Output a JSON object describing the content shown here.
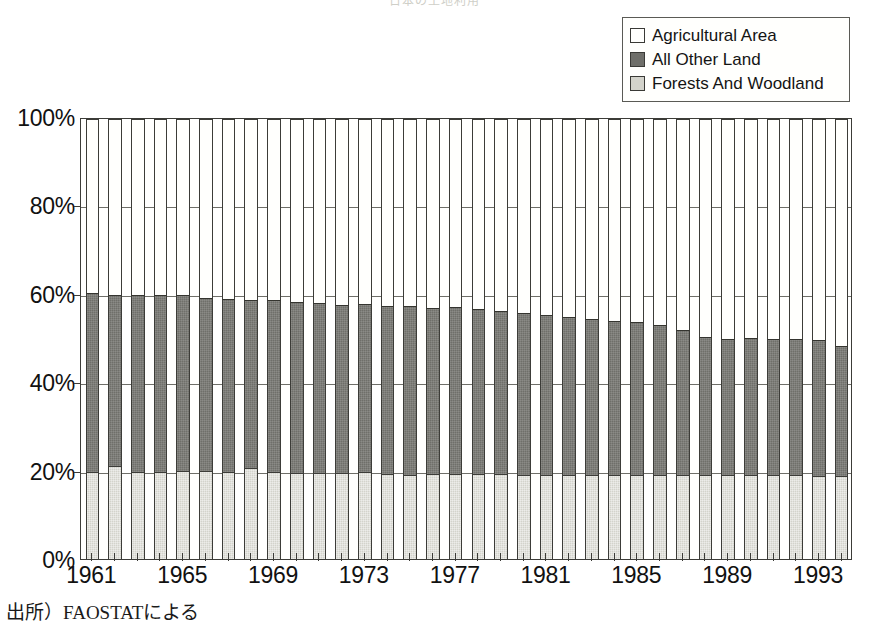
{
  "chart_title": "日本の土地利用",
  "source_note": "出所）FAOSTATによる",
  "legend": {
    "position": "top-right",
    "items": [
      {
        "label": "Agricultural Area",
        "color": "#fffffd",
        "name": "agricultural-area"
      },
      {
        "label": "All Other Land",
        "color": "#6f6f6a",
        "name": "all-other-land"
      },
      {
        "label": "Forests And Woodland",
        "color": "#d3d3cb",
        "name": "forests-and-woodland"
      }
    ]
  },
  "y_axis": {
    "ticks": [
      "0%",
      "20%",
      "40%",
      "60%",
      "80%",
      "100%"
    ],
    "values": [
      0,
      20,
      40,
      60,
      80,
      100
    ]
  },
  "x_axis": {
    "tick_labels": [
      "1961",
      "1965",
      "1969",
      "1973",
      "1977",
      "1981",
      "1985",
      "1989",
      "1993"
    ],
    "tick_years": [
      1961,
      1965,
      1969,
      1973,
      1977,
      1981,
      1985,
      1989,
      1993
    ]
  },
  "chart_data": {
    "type": "bar",
    "stacked": true,
    "normalized": true,
    "title": "日本の土地利用",
    "xlabel": "",
    "ylabel": "",
    "ylim": [
      0,
      100
    ],
    "grid": true,
    "legend_position": "top-right",
    "categories": [
      "1961",
      "1962",
      "1963",
      "1964",
      "1965",
      "1966",
      "1967",
      "1968",
      "1969",
      "1970",
      "1971",
      "1972",
      "1973",
      "1974",
      "1975",
      "1976",
      "1977",
      "1978",
      "1979",
      "1980",
      "1981",
      "1982",
      "1983",
      "1984",
      "1985",
      "1986",
      "1987",
      "1988",
      "1989",
      "1990",
      "1991",
      "1992",
      "1993",
      "1994"
    ],
    "series": [
      {
        "name": "Forests And Woodland",
        "color": "#d3d3cb",
        "values": [
          20.1,
          21.5,
          20.2,
          20.2,
          20.3,
          20.3,
          20.2,
          21.0,
          20.2,
          20.0,
          20.0,
          20.0,
          20.1,
          19.7,
          19.5,
          19.6,
          19.6,
          19.6,
          19.6,
          19.5,
          19.5,
          19.4,
          19.5,
          19.5,
          19.5,
          19.5,
          19.5,
          19.4,
          19.4,
          19.4,
          19.4,
          19.4,
          19.3,
          19.3
        ]
      },
      {
        "name": "All Other Land",
        "color": "#6f6f6a",
        "values": [
          40.6,
          38.7,
          39.9,
          39.9,
          39.8,
          39.1,
          39.1,
          38.1,
          38.9,
          38.5,
          38.3,
          37.9,
          38.1,
          38.0,
          38.2,
          37.7,
          37.8,
          37.5,
          36.9,
          36.6,
          36.1,
          35.7,
          35.2,
          34.9,
          34.5,
          33.9,
          32.7,
          31.2,
          30.9,
          31.1,
          30.9,
          30.8,
          30.6,
          29.3
        ]
      },
      {
        "name": "Agricultural Area",
        "color": "#fffffd",
        "values": [
          39.3,
          39.8,
          39.9,
          39.9,
          39.9,
          40.6,
          40.7,
          40.9,
          40.9,
          41.5,
          41.7,
          42.1,
          41.8,
          42.3,
          42.3,
          42.7,
          42.6,
          42.9,
          43.5,
          43.9,
          44.4,
          44.9,
          45.3,
          45.6,
          46.0,
          46.6,
          47.8,
          49.4,
          49.7,
          49.5,
          49.7,
          49.8,
          50.1,
          51.4
        ]
      }
    ],
    "bar_totals_non_agricultural": [
      60.7,
      60.2,
      60.1,
      60.1,
      60.1,
      59.4,
      59.3,
      59.1,
      59.1,
      58.5,
      58.3,
      57.9,
      58.2,
      57.7,
      57.7,
      57.3,
      57.4,
      57.1,
      56.5,
      56.1,
      55.6,
      55.1,
      54.7,
      54.4,
      54.0,
      53.4,
      52.2,
      50.6,
      50.3,
      50.5,
      50.3,
      50.2,
      49.9,
      48.6
    ]
  }
}
